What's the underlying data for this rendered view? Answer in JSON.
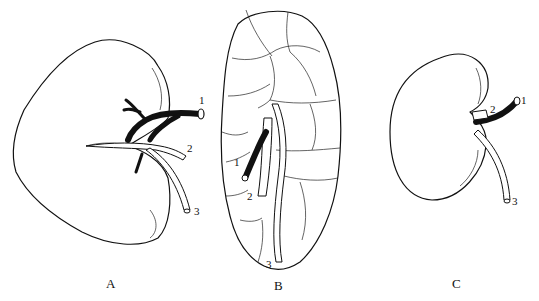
{
  "figure": {
    "panels": [
      {
        "id": "A",
        "label": "A",
        "description": "Lobulated-free kidney (heart-shaped outline) with hilum vessels",
        "callouts": [
          "1",
          "2",
          "3"
        ]
      },
      {
        "id": "B",
        "label": "B",
        "description": "Multilobular (reniculate) kidney with hilum vessels",
        "callouts": [
          "1",
          "2",
          "3"
        ]
      },
      {
        "id": "C",
        "label": "C",
        "description": "Bean-shaped kidney with hilum vessels",
        "callouts": [
          "1",
          "2",
          "3"
        ]
      }
    ],
    "colors": {
      "ink": "#111111",
      "background": "#ffffff"
    }
  }
}
